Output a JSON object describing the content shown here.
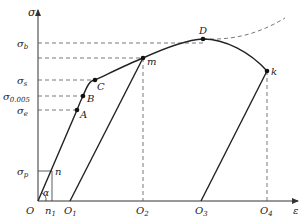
{
  "diagram": {
    "type": "stress-strain curve",
    "axes": {
      "y_label": "σ",
      "x_label": "ε",
      "origin_label": "O"
    },
    "y_ticks": [
      {
        "id": "sigma_b",
        "base": "σ",
        "sub": "b"
      },
      {
        "id": "sigma_s",
        "base": "σ",
        "sub": "s"
      },
      {
        "id": "sigma_0005",
        "base": "σ",
        "sub": "0.005"
      },
      {
        "id": "sigma_e",
        "base": "σ",
        "sub": "e"
      },
      {
        "id": "sigma_p",
        "base": "σ",
        "sub": "p"
      }
    ],
    "x_ticks": [
      {
        "id": "n1",
        "base": "n",
        "sub": "1"
      },
      {
        "id": "O1",
        "base": "O",
        "sub": "1"
      },
      {
        "id": "O2",
        "base": "O",
        "sub": "2"
      },
      {
        "id": "O3",
        "base": "O",
        "sub": "3"
      },
      {
        "id": "O4",
        "base": "O",
        "sub": "4"
      }
    ],
    "points": [
      {
        "label": "n"
      },
      {
        "label": "A"
      },
      {
        "label": "B"
      },
      {
        "label": "C"
      },
      {
        "label": "m"
      },
      {
        "label": "D"
      },
      {
        "label": "k"
      }
    ],
    "angle_label": "α"
  }
}
